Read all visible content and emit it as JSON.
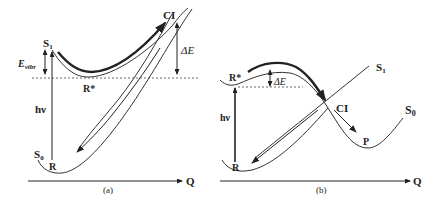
{
  "panel_a": {
    "caption": "(a)",
    "labels": {
      "s1": "S",
      "s1_sub": "1",
      "s0": "S",
      "s0_sub": "0",
      "ci": "CI",
      "r_star": "R*",
      "r": "R",
      "hv": "hν",
      "e_vibr": "E",
      "e_vibr_sub": "vibr",
      "delta_e": "ΔE",
      "axis": "Q"
    }
  },
  "panel_b": {
    "caption": "(b)",
    "labels": {
      "s1": "S",
      "s1_sub": "1",
      "s0": "S",
      "s0_sub": "0",
      "ci": "CI",
      "r_star": "R*",
      "r": "R",
      "p": "P",
      "hv": "hν",
      "delta_e": "ΔE",
      "axis": "Q"
    }
  }
}
